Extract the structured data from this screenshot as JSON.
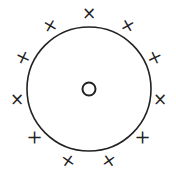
{
  "diagram": {
    "center_label": "O",
    "outer_mark": "×",
    "outer_mark_count": 11,
    "colors": {
      "stroke": "#222222",
      "background": "#ffffff"
    }
  }
}
